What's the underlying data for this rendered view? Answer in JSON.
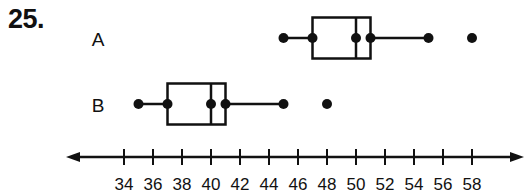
{
  "problem": {
    "number": "25."
  },
  "chart_data": {
    "type": "boxplot",
    "title": "",
    "xlabel": "",
    "ylabel": "",
    "x_ticks": [
      34,
      36,
      38,
      40,
      42,
      44,
      46,
      48,
      50,
      52,
      54,
      56,
      58
    ],
    "xlim": [
      30,
      61
    ],
    "axis_arrows": true,
    "grid": false,
    "series": [
      {
        "name": "A",
        "min": 45,
        "q1": 47,
        "median": 50,
        "q3": 51,
        "max": 55,
        "outliers": [
          58
        ]
      },
      {
        "name": "B",
        "min": 35,
        "q1": 37,
        "median": 40,
        "q3": 41,
        "max": 45,
        "outliers": [
          48
        ]
      }
    ]
  },
  "style": {
    "ink": "#111111",
    "background": "#ffffff"
  }
}
